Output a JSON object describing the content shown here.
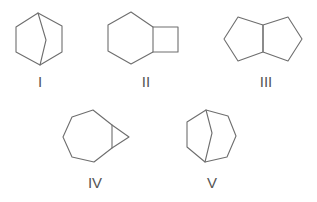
{
  "diagram": {
    "type": "chemical-structures",
    "structures": [
      {
        "label": "I",
        "description": "bicyclo[2.2.1] bridged bicyclic (norbornane skeleton)"
      },
      {
        "label": "II",
        "description": "bicyclo[4.2.0]octane (cyclohexane fused to cyclobutane)"
      },
      {
        "label": "III",
        "description": "bicyclo[3.3.0]octane (two fused cyclopentanes)"
      },
      {
        "label": "IV",
        "description": "bicyclo[5.1.0]octane (cycloheptane fused to cyclopropane)"
      },
      {
        "label": "V",
        "description": "bicyclo[3.2.1]octane bridged bicyclic"
      }
    ]
  },
  "colors": {
    "bond": "#6e6e6e",
    "label": "#555555",
    "background": "#ffffff"
  }
}
